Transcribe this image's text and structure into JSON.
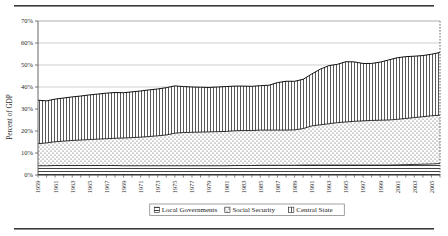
{
  "figure": {
    "has_top_rule": true,
    "has_bottom_rule": true,
    "rule_color": "#3a3a3a"
  },
  "chart_data": {
    "type": "area",
    "stacked": true,
    "title": "",
    "subtitle": "",
    "xlabel": "",
    "ylabel": "Percent of GDP",
    "ylim": [
      0,
      70
    ],
    "yticks": [
      0,
      10,
      20,
      30,
      40,
      50,
      60,
      70
    ],
    "ytick_labels": [
      "0%",
      "10%",
      "20%",
      "30%",
      "40%",
      "50%",
      "60%",
      "70%"
    ],
    "grid": true,
    "grid_axis": "y",
    "legend_position": "bottom-center",
    "x": [
      1959,
      1960,
      1961,
      1962,
      1963,
      1964,
      1965,
      1966,
      1967,
      1968,
      1969,
      1970,
      1971,
      1972,
      1973,
      1974,
      1975,
      1976,
      1977,
      1978,
      1979,
      1980,
      1981,
      1982,
      1983,
      1984,
      1985,
      1986,
      1987,
      1988,
      1989,
      1990,
      1991,
      1992,
      1993,
      1994,
      1995,
      1996,
      1997,
      1998,
      1999,
      2000,
      2001,
      2002,
      2003,
      2004,
      2005,
      2006
    ],
    "xtick_labels": [
      "1959",
      "1961",
      "1963",
      "1965",
      "1967",
      "1969",
      "1971",
      "1973",
      "1975",
      "1977",
      "1979",
      "1981",
      "1983",
      "1985",
      "1987",
      "1989",
      "1991",
      "1993",
      "1995",
      "1997",
      "1999",
      "2001",
      "2003",
      "2005"
    ],
    "xtick_step_years": 2,
    "series": [
      {
        "name": "Local Governments",
        "pattern": "horizontal-lines",
        "legend_key": "local-governments",
        "values": [
          4.2,
          4.2,
          4.3,
          4.3,
          4.3,
          4.3,
          4.3,
          4.3,
          4.3,
          4.3,
          4.2,
          4.2,
          4.2,
          4.2,
          4.2,
          4.2,
          4.2,
          4.2,
          4.2,
          4.2,
          4.2,
          4.2,
          4.2,
          4.3,
          4.3,
          4.3,
          4.4,
          4.4,
          4.4,
          4.4,
          4.4,
          4.5,
          4.5,
          4.5,
          4.5,
          4.5,
          4.5,
          4.5,
          4.5,
          4.5,
          4.5,
          4.5,
          4.6,
          4.7,
          4.8,
          4.9,
          5.0,
          5.2
        ]
      },
      {
        "name": "Social Security",
        "pattern": "dots",
        "legend_key": "social-security",
        "values": [
          10.0,
          10.4,
          10.8,
          11.1,
          11.4,
          11.6,
          11.8,
          12.0,
          12.2,
          12.4,
          12.6,
          12.8,
          13.0,
          13.3,
          13.6,
          14.0,
          14.8,
          15.1,
          15.2,
          15.3,
          15.4,
          15.5,
          15.6,
          15.8,
          15.9,
          15.9,
          16.0,
          16.0,
          16.0,
          16.0,
          16.1,
          16.6,
          17.8,
          18.3,
          18.8,
          19.3,
          19.6,
          19.9,
          20.1,
          20.3,
          20.4,
          20.5,
          20.7,
          21.0,
          21.3,
          21.6,
          21.9,
          22.0
        ]
      },
      {
        "name": "Central State",
        "pattern": "vertical-lines",
        "legend_key": "central-state",
        "values": [
          19.8,
          19.1,
          19.4,
          19.6,
          19.8,
          20.0,
          20.3,
          20.5,
          20.7,
          20.8,
          20.6,
          20.8,
          21.0,
          21.2,
          21.3,
          21.5,
          21.5,
          20.9,
          20.6,
          20.4,
          20.2,
          20.3,
          20.4,
          20.3,
          20.2,
          20.1,
          20.2,
          20.4,
          21.6,
          22.2,
          22.1,
          22.4,
          23.6,
          25.3,
          26.4,
          26.5,
          27.4,
          27.0,
          26.1,
          25.9,
          26.4,
          27.3,
          28.0,
          28.1,
          27.9,
          27.8,
          28.0,
          28.5
        ]
      }
    ],
    "totals": [
      34.0,
      33.7,
      34.5,
      35.0,
      35.5,
      35.9,
      36.4,
      36.8,
      37.2,
      37.5,
      37.4,
      37.8,
      38.2,
      38.7,
      39.1,
      39.7,
      40.5,
      40.2,
      40.0,
      39.9,
      39.8,
      40.0,
      40.2,
      40.4,
      40.4,
      40.3,
      40.6,
      40.8,
      42.0,
      42.6,
      42.6,
      43.5,
      45.9,
      48.1,
      49.7,
      50.3,
      51.5,
      51.4,
      50.7,
      50.7,
      51.3,
      52.3,
      53.3,
      53.8,
      54.0,
      54.3,
      54.9,
      55.7
    ]
  },
  "legend": {
    "items": [
      {
        "label": "Local Governments",
        "swatch": "local-governments"
      },
      {
        "label": "Social Security",
        "swatch": "social-security"
      },
      {
        "label": "Central State",
        "swatch": "central-state"
      }
    ]
  },
  "axis": {
    "y_title": "Percent of GDP"
  }
}
